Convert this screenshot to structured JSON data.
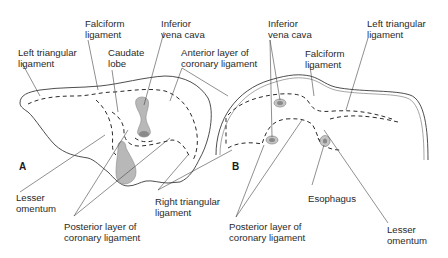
{
  "figure": {
    "panel_a": {
      "letter": "A",
      "labels": {
        "falciform_1": "Falciform",
        "falciform_2": "ligament",
        "ivc_1": "Inferior",
        "ivc_2": "vena cava",
        "left_tri_1": "Left triangular",
        "left_tri_2": "ligament",
        "caudate_1": "Caudate",
        "caudate_2": "lobe",
        "anterior_1": "Anterior layer of",
        "anterior_2": "coronary ligament",
        "lesser_1": "Lesser",
        "lesser_2": "omentum",
        "posterior_1": "Posterior layer of",
        "posterior_2": "coronary ligament",
        "right_tri_1": "Right triangular",
        "right_tri_2": "ligament"
      }
    },
    "panel_b": {
      "letter": "B",
      "labels": {
        "ivc_1": "Inferior",
        "ivc_2": "vena cava",
        "left_tri_1": "Left triangular",
        "left_tri_2": "ligament",
        "falciform_1": "Falciform",
        "falciform_2": "ligament",
        "esophagus": "Esophagus",
        "posterior_1": "Posterior layer of",
        "posterior_2": "coronary ligament",
        "lesser_1": "Lesser",
        "lesser_2": "omentum"
      }
    },
    "colors": {
      "line": "#3a3a3a",
      "organ_fill": "#b8b8b8",
      "background": "#ffffff"
    }
  }
}
